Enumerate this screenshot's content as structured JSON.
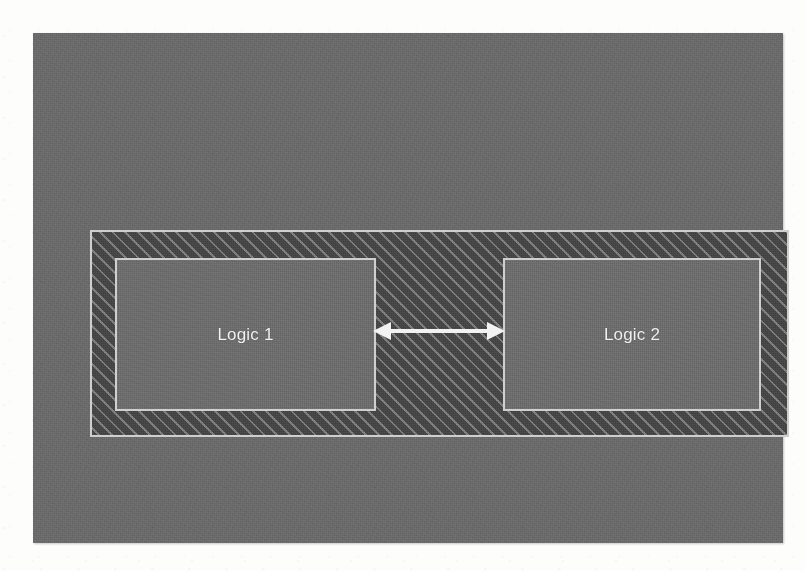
{
  "slide": {
    "canvas_bg_color": "#6b6b6b",
    "page_bg_color": "#fdfdfc"
  },
  "diagram": {
    "title": "",
    "outer_region": {
      "name": "hatched-region",
      "fill_color": "#474747",
      "hatch_color": "#cfcfcf",
      "hatch_angle_deg": 45,
      "border_color": "#cfcfcf",
      "label": ""
    },
    "blocks": [
      {
        "id": "logic-1",
        "label": "Logic 1",
        "fill_color": "#6e6e6e",
        "border_color": "#cfcfcf",
        "text_color": "#f2f2f2"
      },
      {
        "id": "logic-2",
        "label": "Logic 2",
        "fill_color": "#6e6e6e",
        "border_color": "#cfcfcf",
        "text_color": "#f2f2f2"
      }
    ],
    "connector": {
      "id": "logic1-logic2-connector",
      "type": "double-headed-arrow",
      "color": "#f2f2f2",
      "label": "",
      "from": "Logic 1",
      "to": "Logic 2"
    }
  }
}
